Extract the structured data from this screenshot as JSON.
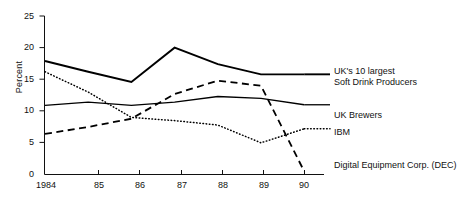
{
  "chart_data": {
    "type": "line",
    "title": "",
    "xlabel": "",
    "ylabel": "Percent",
    "x": [
      "1984",
      "85",
      "86",
      "87",
      "88",
      "89",
      "90"
    ],
    "xtick_labels": [
      "1984",
      "85",
      "86",
      "87",
      "88",
      "89",
      "90"
    ],
    "ytick_labels": [
      "0",
      "5",
      "10",
      "15",
      "20",
      "25"
    ],
    "ytick_values": [
      0,
      5,
      10,
      15,
      20,
      25
    ],
    "ylim": [
      0,
      25
    ],
    "grid": false,
    "legend_position": "right-of-plot-inline",
    "series": [
      {
        "name": "UK's 10 largest Soft Drink Producers",
        "legend_lines": [
          "UK's 10 largest",
          "Soft Drink Producers"
        ],
        "style": "solid-thick",
        "color": "#000000",
        "values": [
          17.9,
          16.2,
          14.6,
          20.0,
          17.4,
          15.8,
          15.8
        ]
      },
      {
        "name": "UK Brewers",
        "legend_lines": [
          "UK Brewers"
        ],
        "style": "solid-thin",
        "color": "#000000",
        "values": [
          10.9,
          11.4,
          10.9,
          11.4,
          12.3,
          12.0,
          11.0
        ]
      },
      {
        "name": "IBM",
        "legend_lines": [
          "IBM"
        ],
        "style": "dotted",
        "color": "#000000",
        "values": [
          16.2,
          13.0,
          9.0,
          8.5,
          7.8,
          5.0,
          7.2
        ]
      },
      {
        "name": "Digital Equipment Corp. (DEC)",
        "legend_lines": [
          "Digital Equipment Corp. (DEC)"
        ],
        "style": "dashed",
        "color": "#000000",
        "values": [
          6.4,
          7.5,
          8.8,
          12.7,
          14.8,
          14.0,
          0.5
        ]
      }
    ]
  },
  "axis": {
    "y_label": "Percent"
  }
}
